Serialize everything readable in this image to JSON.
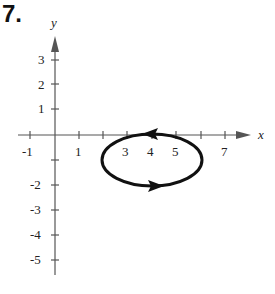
{
  "problem_number": "7.",
  "axes": {
    "x_label": "x",
    "y_label": "y",
    "x_ticks": [
      "-1",
      "1",
      "3",
      "4",
      "5",
      "7"
    ],
    "y_ticks_pos": [
      "3",
      "2",
      "1"
    ],
    "y_ticks_neg": [
      "-2",
      "-3",
      "-4",
      "-5"
    ]
  },
  "curve": {
    "type": "ellipse",
    "center": [
      4,
      -1
    ],
    "semi_x": 2,
    "semi_y": 1,
    "orientation": "clockwise",
    "color": "#111111"
  }
}
